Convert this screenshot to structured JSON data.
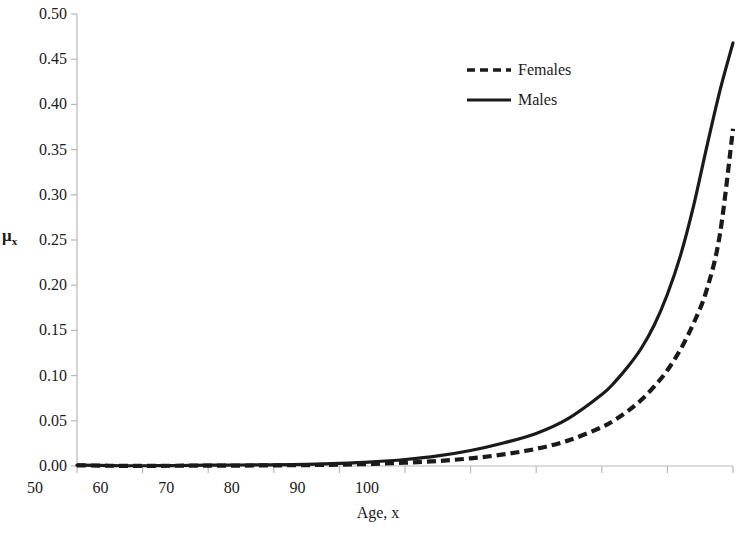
{
  "chart_data": {
    "type": "line",
    "title": "",
    "xlabel": "Age, x",
    "ylabel": "μx",
    "ylabel_base": "μ",
    "ylabel_sub": "x",
    "xlim": [
      0,
      100
    ],
    "ylim": [
      0,
      0.5
    ],
    "xticks": [
      0,
      10,
      20,
      30,
      40,
      50,
      60,
      70,
      80,
      90,
      100
    ],
    "xtick_labels": [
      "0",
      "10",
      "20",
      "30",
      "40",
      "50",
      "60",
      "70",
      "80",
      "90",
      "100"
    ],
    "yticks": [
      0.0,
      0.05,
      0.1,
      0.15,
      0.2,
      0.25,
      0.3,
      0.35,
      0.4,
      0.45,
      0.5
    ],
    "ytick_labels": [
      "0.00",
      "0.05",
      "0.10",
      "0.15",
      "0.20",
      "0.25",
      "0.30",
      "0.35",
      "0.40",
      "0.45",
      "0.50"
    ],
    "grid": false,
    "legend_position": "upper-center-right",
    "legend": [
      "Females",
      "Males"
    ],
    "axis_color": "#b8b8b8",
    "series": [
      {
        "name": "Females",
        "style": "dashed",
        "color": "#1a1a1a",
        "x": [
          0,
          5,
          10,
          15,
          20,
          25,
          30,
          35,
          40,
          45,
          50,
          55,
          60,
          65,
          70,
          75,
          80,
          82,
          84,
          86,
          88,
          90,
          92,
          94,
          96,
          98,
          100
        ],
        "values": [
          0.0008,
          0.0003,
          0.0002,
          0.0003,
          0.0004,
          0.0005,
          0.0007,
          0.001,
          0.0015,
          0.0023,
          0.0036,
          0.0055,
          0.0085,
          0.0128,
          0.019,
          0.0285,
          0.043,
          0.051,
          0.061,
          0.073,
          0.088,
          0.106,
          0.129,
          0.158,
          0.195,
          0.256,
          0.373
        ]
      },
      {
        "name": "Males",
        "style": "solid",
        "color": "#1a1a1a",
        "x": [
          0,
          5,
          10,
          15,
          20,
          25,
          30,
          35,
          40,
          45,
          50,
          55,
          60,
          65,
          70,
          75,
          80,
          82,
          84,
          86,
          88,
          90,
          92,
          94,
          96,
          98,
          100
        ],
        "values": [
          0.001,
          0.0004,
          0.0003,
          0.0005,
          0.0009,
          0.0011,
          0.0013,
          0.0018,
          0.0028,
          0.0045,
          0.0072,
          0.0112,
          0.0172,
          0.0255,
          0.036,
          0.053,
          0.079,
          0.093,
          0.11,
          0.13,
          0.156,
          0.19,
          0.233,
          0.288,
          0.353,
          0.415,
          0.468
        ]
      }
    ]
  }
}
